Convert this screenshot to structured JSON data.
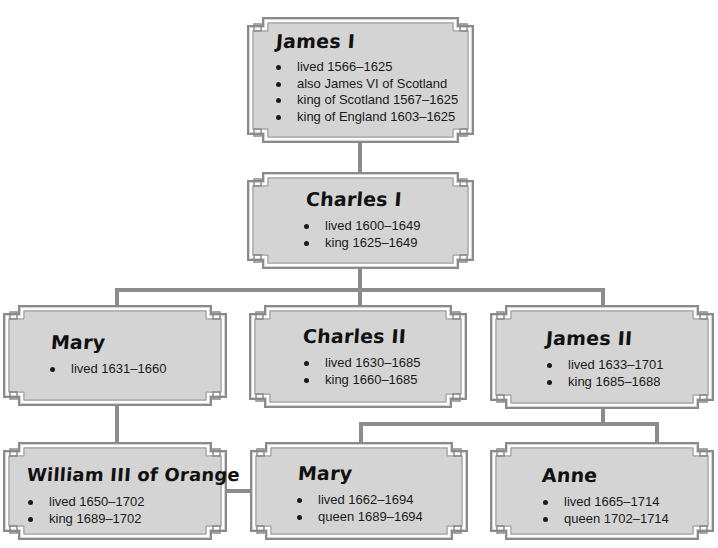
{
  "diagram": {
    "title_cropped": "",
    "colors": {
      "box_fill": "#d4d4d4",
      "box_border": "#8a8a8a",
      "connector": "#8c8c8c",
      "text": "#1a1a1a"
    },
    "nodes": {
      "james_i": {
        "name": "James I",
        "facts": [
          "lived 1566–1625",
          "also James VI of Scotland",
          "king of Scotland 1567–1625",
          "king of England 1603–1625"
        ]
      },
      "charles_i": {
        "name": "Charles I",
        "facts": [
          "lived 1600–1649",
          "king 1625–1649"
        ]
      },
      "mary_1631": {
        "name": "Mary",
        "facts": [
          "lived 1631–1660"
        ]
      },
      "charles_ii": {
        "name": "Charles II",
        "facts": [
          "lived 1630–1685",
          "king 1660–1685"
        ]
      },
      "james_ii": {
        "name": "James II",
        "facts": [
          "lived 1633–1701",
          "king 1685–1688"
        ]
      },
      "william_iii": {
        "name": "William III of Orange",
        "facts": [
          "lived 1650–1702",
          "king 1689–1702"
        ]
      },
      "mary_1662": {
        "name": "Mary",
        "facts": [
          "lived 1662–1694",
          "queen 1689–1694"
        ]
      },
      "anne": {
        "name": "Anne",
        "facts": [
          "lived 1665–1714",
          "queen 1702–1714"
        ]
      }
    },
    "edges": [
      {
        "from": "James I",
        "to": "Charles I",
        "type": "parent-child"
      },
      {
        "from": "Charles I",
        "to": "Mary",
        "type": "parent-child"
      },
      {
        "from": "Charles I",
        "to": "Charles II",
        "type": "parent-child"
      },
      {
        "from": "Charles I",
        "to": "James II",
        "type": "parent-child"
      },
      {
        "from": "Mary (1631–1660)",
        "to": "William III of Orange",
        "type": "parent-child"
      },
      {
        "from": "James II",
        "to": "Mary (1662–1694)",
        "type": "parent-child"
      },
      {
        "from": "James II",
        "to": "Anne",
        "type": "parent-child"
      },
      {
        "from": "William III of Orange",
        "to": "Mary (1662–1694)",
        "type": "marriage"
      }
    ]
  }
}
